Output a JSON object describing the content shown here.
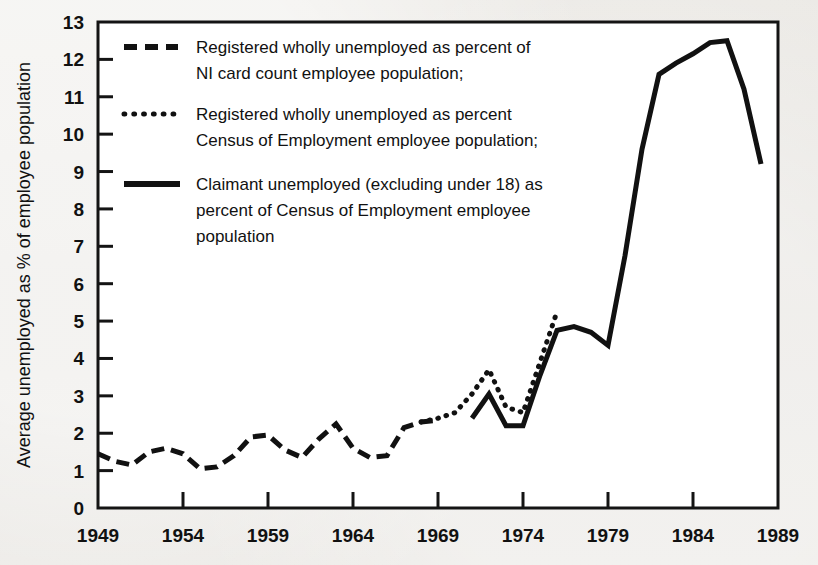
{
  "figure": {
    "background_color": "#e9e7e3",
    "plot_background_color": "#ffffff",
    "ink_color": "#111111"
  },
  "axes": {
    "y_title": "Average unemployed as % of employee population",
    "y_ticks": [
      "0",
      "1",
      "2",
      "3",
      "4",
      "5",
      "6",
      "7",
      "8",
      "9",
      "10",
      "11",
      "12",
      "13"
    ],
    "x_ticks": [
      "1949",
      "1954",
      "1959",
      "1964",
      "1969",
      "1974",
      "1979",
      "1984",
      "1989"
    ]
  },
  "legend": {
    "items": [
      {
        "style": "dashed",
        "line1": "Registered wholly unemployed as percent of",
        "line2": "NI card count employee population;"
      },
      {
        "style": "dotted",
        "line1": "Registered wholly unemployed as percent",
        "line2": "Census of Employment employee population;"
      },
      {
        "style": "solid",
        "line1": "Claimant unemployed (excluding under 18) as",
        "line2": "percent of Census of Employment employee",
        "line3": "population"
      }
    ]
  },
  "chart_data": {
    "type": "line",
    "title": "",
    "xlabel": "",
    "ylabel": "Average unemployed as % of employee population",
    "xlim": [
      1949,
      1989
    ],
    "ylim": [
      0,
      13
    ],
    "grid": false,
    "legend_position": "upper-left-inside",
    "xticks": [
      1949,
      1954,
      1959,
      1964,
      1969,
      1974,
      1979,
      1984,
      1989
    ],
    "yticks": [
      0,
      1,
      2,
      3,
      4,
      5,
      6,
      7,
      8,
      9,
      10,
      11,
      12,
      13
    ],
    "series": [
      {
        "name": "Registered wholly unemployed as percent of NI card count employee population",
        "style": "dashed",
        "x": [
          1949,
          1950,
          1951,
          1952,
          1953,
          1954,
          1955,
          1956,
          1957,
          1958,
          1959,
          1960,
          1961,
          1962,
          1963,
          1964,
          1965,
          1966,
          1967,
          1968,
          1969
        ],
        "y": [
          1.45,
          1.25,
          1.15,
          1.5,
          1.6,
          1.45,
          1.05,
          1.1,
          1.4,
          1.9,
          1.95,
          1.55,
          1.35,
          1.85,
          2.25,
          1.6,
          1.35,
          1.4,
          2.15,
          2.3,
          2.35
        ]
      },
      {
        "name": "Registered wholly unemployed as percent Census of Employment employee population",
        "style": "dotted",
        "x": [
          1968,
          1969,
          1970,
          1971,
          1972,
          1973,
          1974,
          1975,
          1976
        ],
        "y": [
          2.3,
          2.4,
          2.55,
          3.05,
          3.7,
          2.7,
          2.55,
          3.9,
          5.25
        ]
      },
      {
        "name": "Claimant unemployed (excluding under 18) as percent of Census of Employment employee population",
        "style": "solid",
        "x": [
          1971,
          1972,
          1973,
          1974,
          1975,
          1976,
          1977,
          1978,
          1979,
          1980,
          1981,
          1982,
          1983,
          1984,
          1985,
          1986,
          1987,
          1988
        ],
        "y": [
          2.4,
          3.05,
          2.2,
          2.2,
          3.55,
          4.75,
          4.85,
          4.7,
          4.35,
          6.75,
          9.6,
          11.6,
          11.9,
          12.15,
          12.45,
          12.5,
          11.2,
          9.2
        ]
      }
    ]
  }
}
